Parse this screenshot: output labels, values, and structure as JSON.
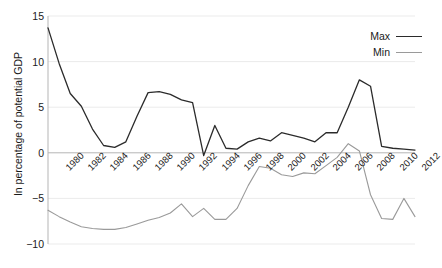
{
  "chart_data": {
    "type": "line",
    "title": "",
    "xlabel": "",
    "ylabel": "In percentage of potential GDP",
    "ylim": [
      -10,
      15
    ],
    "xlim": [
      1980,
      2013
    ],
    "yticks": [
      15,
      10,
      5,
      0,
      -5,
      -10
    ],
    "ytick_labels": [
      "15",
      "10",
      "5",
      "0",
      "−5",
      "−10"
    ],
    "xticks": [
      1980,
      1982,
      1984,
      1986,
      1988,
      1990,
      1992,
      1994,
      1996,
      1998,
      2000,
      2002,
      2004,
      2006,
      2008,
      2010,
      2012
    ],
    "xtick_labels": [
      "1980",
      "1982",
      "1984",
      "1986",
      "1988",
      "1990",
      "1992",
      "1994",
      "1996",
      "1998",
      "2000",
      "2002",
      "2004",
      "2006",
      "2008",
      "2010",
      "2012"
    ],
    "x": [
      1980,
      1981,
      1982,
      1983,
      1984,
      1985,
      1986,
      1987,
      1988,
      1989,
      1990,
      1991,
      1992,
      1993,
      1994,
      1995,
      1996,
      1997,
      1998,
      1999,
      2000,
      2001,
      2002,
      2003,
      2004,
      2005,
      2006,
      2007,
      2008,
      2009,
      2010,
      2011,
      2012,
      2013
    ],
    "grid": true,
    "grid_axis": "y",
    "zero_line": true,
    "legend_position": "top-right",
    "series": [
      {
        "name": "Max",
        "color": "#2b2b2b",
        "width": 1.3,
        "values": [
          13.7,
          9.8,
          6.5,
          5.1,
          2.6,
          0.8,
          0.6,
          1.2,
          4.0,
          6.6,
          6.7,
          6.4,
          5.8,
          5.5,
          -0.3,
          3.0,
          0.5,
          0.4,
          1.2,
          1.6,
          1.3,
          2.2,
          1.9,
          1.6,
          1.2,
          2.2,
          2.2,
          5.0,
          8.0,
          7.3,
          0.7,
          0.5,
          0.4,
          0.3
        ]
      },
      {
        "name": "Min",
        "color": "#9a9a9a",
        "width": 1.1,
        "values": [
          -6.3,
          -7.0,
          -7.6,
          -8.1,
          -8.3,
          -8.4,
          -8.4,
          -8.2,
          -7.8,
          -7.4,
          -7.1,
          -6.6,
          -5.6,
          -7.0,
          -6.1,
          -7.3,
          -7.3,
          -6.1,
          -3.6,
          -1.5,
          -1.7,
          -2.4,
          -2.6,
          -2.2,
          -2.3,
          -1.4,
          -0.5,
          1.0,
          0.2,
          -4.6,
          -7.2,
          -7.3,
          -5.0,
          -7.0
        ]
      }
    ]
  },
  "legend": {
    "entries": [
      {
        "label": "Max"
      },
      {
        "label": "Min"
      }
    ]
  }
}
